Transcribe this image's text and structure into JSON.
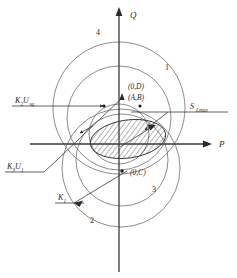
{
  "figure": {
    "kind": "pq-capability-diagram",
    "background_color": "#ffffff",
    "line_color": "#3a3a3a",
    "circle_color": "#6e6e6e"
  },
  "axes": {
    "horizontal_label": "P",
    "vertical_label": "Q",
    "origin_label": "O"
  },
  "quadrant_labels": [
    {
      "id": "region-4",
      "text": "4"
    },
    {
      "id": "region-1",
      "text": "1"
    },
    {
      "id": "region-2",
      "text": "2"
    },
    {
      "id": "region-3",
      "text": "3"
    }
  ],
  "point_labels": [
    {
      "id": "center-d",
      "text": "(0,D)"
    },
    {
      "id": "center-ab",
      "text": "(A,B)"
    },
    {
      "id": "center-c",
      "text": "(0,C)"
    }
  ],
  "annotations": [
    {
      "id": "k2-usq",
      "base": "K",
      "base_sub": "2",
      "second": "U",
      "second_sub": "sq"
    },
    {
      "id": "k3-u1",
      "base": "K",
      "base_sub": "3",
      "second": "U",
      "second_sub": "1"
    },
    {
      "id": "k1",
      "base": "K",
      "base_sub": "1",
      "second": "",
      "second_sub": ""
    },
    {
      "id": "s-lmax",
      "base": "S",
      "base_sub": "Lmax",
      "second": "",
      "second_sub": ""
    }
  ],
  "hatched_region": {
    "id": "feasible-region",
    "description": "hatched ellipse",
    "hatch_angle_deg": 45
  }
}
